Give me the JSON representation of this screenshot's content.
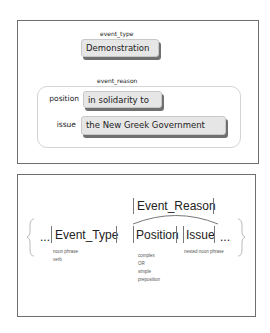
{
  "top_panel": {
    "event_type": {
      "label": "event_type",
      "value": "Demonstration"
    },
    "event_reason": {
      "label": "event_reason",
      "rows": [
        {
          "label": "position",
          "value": "in solidarity to"
        },
        {
          "label": "issue",
          "value": "the New Greek Government"
        }
      ]
    }
  },
  "bottom_panel": {
    "leading_ellipsis": "...",
    "trailing_ellipsis": "...",
    "event_type": {
      "label": "Event_Type",
      "annotations": [
        "noun phrase",
        "verb"
      ]
    },
    "event_reason": {
      "label": "Event_Reason"
    },
    "position": {
      "label": "Position",
      "annotations": [
        "complex",
        "OR",
        "simple",
        "preposition"
      ]
    },
    "issue": {
      "label": "Issue",
      "annotations": [
        "nested noun phrase"
      ]
    }
  },
  "colors": {
    "box_fill": "#e6e6e6",
    "box_shadow": "#707070",
    "panel_border": "#6e6e6e",
    "container_border": "#d4d4d4",
    "bar_color": "#777777"
  }
}
